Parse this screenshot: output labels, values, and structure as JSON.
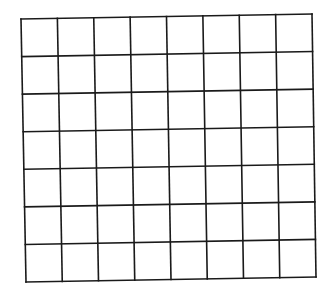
{
  "grid": {
    "columns": 8,
    "rows": 7,
    "line_color": "#1a1a1a",
    "background": "#ffffff",
    "line_width": 1.6,
    "corners": {
      "top_left": [
        21,
        19
      ],
      "top_right": [
        312,
        14
      ],
      "bottom_right": [
        316,
        277
      ],
      "bottom_left": [
        26,
        282
      ]
    }
  }
}
